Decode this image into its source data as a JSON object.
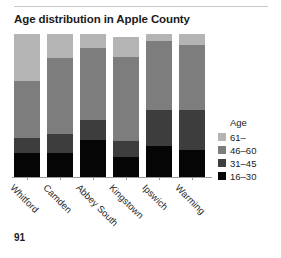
{
  "page": {
    "page_number": "91"
  },
  "chart_data": {
    "type": "bar",
    "title": "Age distribution in Apple County",
    "xlabel": "",
    "ylabel": "",
    "ylim": [
      0,
      100
    ],
    "grid": false,
    "stacked": true,
    "stack_order": "top_to_bottom",
    "legend_position": "right",
    "legend_title": "Age",
    "categories": [
      "Whitford",
      "Camden",
      "Abbey South",
      "Kingstown",
      "Ipswich",
      "Warming"
    ],
    "series": [
      {
        "name": "61–",
        "color": "#b4b4b4",
        "values": [
          33,
          17,
          10,
          14,
          5,
          8
        ]
      },
      {
        "name": "46–60",
        "color": "#7d7d7d",
        "values": [
          40,
          53,
          50,
          60,
          48,
          45
        ]
      },
      {
        "name": "31–45",
        "color": "#3d3d3d",
        "values": [
          10,
          13,
          14,
          12,
          25,
          28
        ]
      },
      {
        "name": "16–30",
        "color": "#050505",
        "values": [
          17,
          17,
          26,
          14,
          22,
          19
        ]
      }
    ],
    "bar_heights_pct": [
      100,
      100,
      100,
      98,
      100,
      100
    ]
  },
  "colors": {
    "background": "#ffffff",
    "text": "#1b1b1b",
    "axis": "#9a9a9a",
    "rule": "#c9c9c9"
  }
}
